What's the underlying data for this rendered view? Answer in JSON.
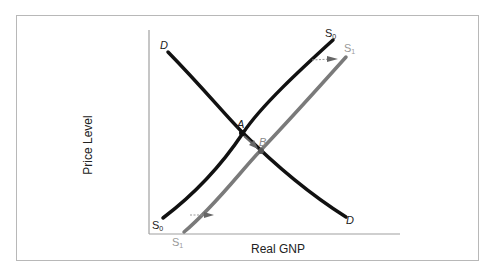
{
  "diagram": {
    "type": "aggregate-supply-demand-shift",
    "axes": {
      "y_label": "Price Level",
      "x_label": "Real GNP"
    },
    "curves": [
      {
        "id": "demand",
        "label_start": "D",
        "label_end": "D",
        "color": "#111111"
      },
      {
        "id": "supply-0",
        "label": "S",
        "subscript": "0",
        "color": "#111111"
      },
      {
        "id": "supply-1",
        "label": "S",
        "subscript": "1",
        "color": "#7a7a7a"
      }
    ],
    "points": [
      {
        "label": "A",
        "meaning": "initial equilibrium (D ∩ S0)"
      },
      {
        "label": "B",
        "meaning": "new equilibrium (D ∩ S1)"
      }
    ],
    "arrows": [
      {
        "from": "S0",
        "to": "S1",
        "meaning": "supply shifts right (top)"
      },
      {
        "from": "S0",
        "to": "S1",
        "meaning": "supply shifts right (bottom)"
      },
      {
        "from": "A",
        "to": "B",
        "meaning": "movement along demand curve"
      }
    ]
  },
  "labels": {
    "d_top": "D",
    "d_bottom": "D",
    "s0_top": "S",
    "s0_top_sub": "0",
    "s1_top": "S",
    "s1_top_sub": "1",
    "s0_bottom": "S",
    "s0_bottom_sub": "0",
    "s1_bottom": "S",
    "s1_bottom_sub": "1",
    "point_a": "A",
    "point_b": "B"
  }
}
